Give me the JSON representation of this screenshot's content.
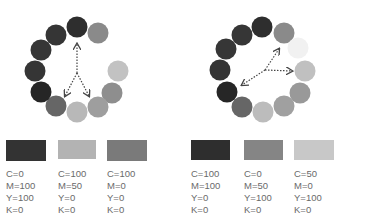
{
  "left_wheel": {
    "circles": [
      {
        "cx": 77,
        "cy": 27,
        "color": "#2e2e2e"
      },
      {
        "cx": 98,
        "cy": 33,
        "color": "#8a8a8a"
      },
      {
        "cx": 113,
        "cy": 49,
        "color": "#ffffff"
      },
      {
        "cx": 118,
        "cy": 71,
        "color": "#c2c2c2"
      },
      {
        "cx": 112,
        "cy": 93,
        "color": "#8e8e8e"
      },
      {
        "cx": 98,
        "cy": 107,
        "color": "#9e9e9e"
      },
      {
        "cx": 77,
        "cy": 112,
        "color": "#b8b8b8"
      },
      {
        "cx": 56,
        "cy": 106,
        "color": "#666666"
      },
      {
        "cx": 41,
        "cy": 92,
        "color": "#262626"
      },
      {
        "cx": 35,
        "cy": 71,
        "color": "#353535"
      },
      {
        "cx": 41,
        "cy": 50,
        "color": "#363636"
      },
      {
        "cx": 56,
        "cy": 35,
        "color": "#353535"
      }
    ],
    "arrows": {
      "origin": [
        77,
        73
      ],
      "targets": [
        [
          77,
          44
        ],
        [
          65,
          96
        ],
        [
          89,
          96
        ]
      ]
    }
  },
  "right_wheel": {
    "circles": [
      {
        "cx": 262,
        "cy": 27,
        "color": "#2e2e2e"
      },
      {
        "cx": 284,
        "cy": 33,
        "color": "#8a8a8a"
      },
      {
        "cx": 298,
        "cy": 48,
        "color": "#f1f1f1"
      },
      {
        "cx": 305,
        "cy": 71,
        "color": "#c0c0c0"
      },
      {
        "cx": 300,
        "cy": 93,
        "color": "#999999"
      },
      {
        "cx": 284,
        "cy": 106,
        "color": "#a0a0a0"
      },
      {
        "cx": 263,
        "cy": 112,
        "color": "#bcbcbc"
      },
      {
        "cx": 242,
        "cy": 107,
        "color": "#666666"
      },
      {
        "cx": 227,
        "cy": 92,
        "color": "#262626"
      },
      {
        "cx": 220,
        "cy": 70,
        "color": "#353535"
      },
      {
        "cx": 226,
        "cy": 49,
        "color": "#363636"
      },
      {
        "cx": 242,
        "cy": 35,
        "color": "#363636"
      }
    ],
    "arrows": {
      "origin": [
        265,
        70
      ],
      "targets": [
        [
          279,
          49
        ],
        [
          292,
          71
        ],
        [
          242,
          85
        ]
      ]
    }
  },
  "swatches": [
    {
      "x": 6,
      "color": "#333333",
      "c": "C=0",
      "m": "M=100",
      "y": "Y=100",
      "k": "K=0"
    },
    {
      "x": 58,
      "color": "#b3b3b3",
      "c": "C=100",
      "m": "M=50",
      "y": "Y=0",
      "k": "K=0"
    },
    {
      "x": 107,
      "color": "#7a7a7a",
      "c": "C=100",
      "m": "M=0",
      "y": "Y=0",
      "k": "K=0"
    },
    {
      "x": 191,
      "color": "#2e2e2e",
      "c": "C=100",
      "m": "M=100",
      "y": "Y=0",
      "k": "K=0"
    },
    {
      "x": 244,
      "color": "#858585",
      "c": "C=0",
      "m": "M=50",
      "y": "Y=100",
      "k": "K=0"
    },
    {
      "x": 294,
      "color": "#c8c8c8",
      "c": "C=50",
      "m": "M=0",
      "y": "Y=100",
      "k": "K=0"
    }
  ]
}
